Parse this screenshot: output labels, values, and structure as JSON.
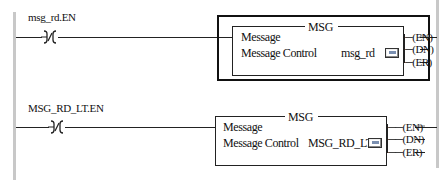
{
  "rungs": [
    {
      "contact": {
        "tag": "msg_rd.EN",
        "type": "XIO"
      },
      "instruction": {
        "mnemonic": "MSG",
        "rows": [
          {
            "label": "Message",
            "value": ""
          },
          {
            "label": "Message Control",
            "value": "msg_rd"
          }
        ],
        "ellipsis_button": "...",
        "outputs": [
          "EN",
          "DN",
          "ER"
        ],
        "selected": true
      }
    },
    {
      "contact": {
        "tag": "MSG_RD_LT.EN",
        "type": "XIO"
      },
      "instruction": {
        "mnemonic": "MSG",
        "rows": [
          {
            "label": "Message",
            "value": ""
          },
          {
            "label": "Message Control",
            "value": "MSG_RD_LT"
          }
        ],
        "ellipsis_button": "...",
        "outputs": [
          "EN",
          "DN",
          "ER"
        ],
        "selected": false
      }
    }
  ],
  "colors": {
    "rail": "#c8c8c8",
    "wire": "#222222",
    "selection_border": "#111111",
    "energized_highlight": "#b9b9b9"
  }
}
